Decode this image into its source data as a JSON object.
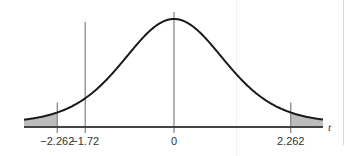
{
  "chart_data": {
    "type": "area",
    "title": "",
    "xlabel": "t",
    "ylabel": "",
    "distribution": "Student t (symmetric bell curve)",
    "xlim": [
      -3.4,
      3.4
    ],
    "grid": false,
    "legend": null,
    "curve": {
      "name": "t density",
      "color": "#1a1a1a"
    },
    "shaded_regions": [
      {
        "name": "left-tail",
        "from": -3.4,
        "to": -2.262,
        "color": "#bdbdbd"
      },
      {
        "name": "right-tail",
        "from": 2.262,
        "to": 3.4,
        "color": "#bdbdbd"
      }
    ],
    "reference_lines": [
      {
        "name": "neg-critical",
        "x": -2.262,
        "label": "−2.262"
      },
      {
        "name": "observed",
        "x": -1.72,
        "label": "−1.72"
      },
      {
        "name": "center",
        "x": 0,
        "label": "0"
      },
      {
        "name": "pos-critical",
        "x": 2.262,
        "label": "2.262"
      }
    ],
    "colors": {
      "axis": "#444444",
      "ref_line": "#8a8a8a",
      "shade": "#bdbdbd",
      "curve": "#1a1a1a"
    }
  }
}
